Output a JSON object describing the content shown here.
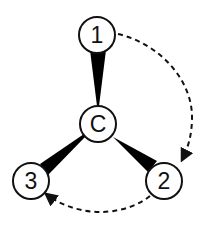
{
  "diagram": {
    "type": "stereochemistry-wedge-projection",
    "center": {
      "label": "C",
      "x": 98,
      "y": 124
    },
    "substituents": [
      {
        "label": "1",
        "x": 97,
        "y": 35
      },
      {
        "label": "2",
        "x": 164,
        "y": 181
      },
      {
        "label": "3",
        "x": 31,
        "y": 181
      }
    ],
    "bonds": [
      {
        "from": "C",
        "to": "1",
        "style": "wedge"
      },
      {
        "from": "C",
        "to": "2",
        "style": "wedge"
      },
      {
        "from": "C",
        "to": "3",
        "style": "wedge"
      }
    ],
    "arrows": [
      {
        "from": "1",
        "to": "2",
        "style": "dashed",
        "direction": "clockwise"
      },
      {
        "from": "2",
        "to": "3",
        "style": "dashed",
        "direction": "clockwise"
      }
    ],
    "colors": {
      "stroke": "#111111",
      "fill": "#ffffff",
      "wedge": "#000000"
    }
  }
}
